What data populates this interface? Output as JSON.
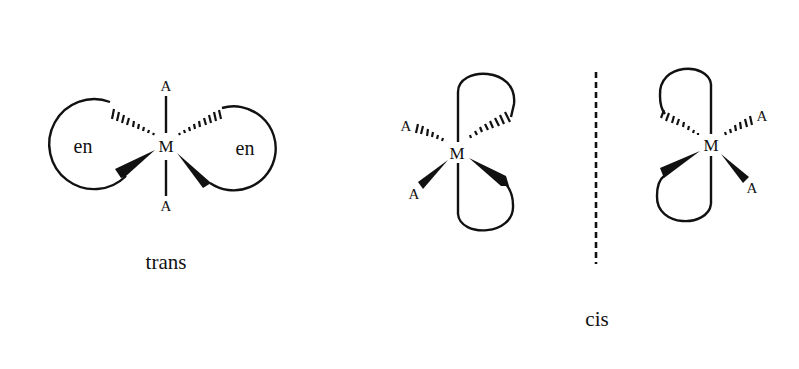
{
  "figure": {
    "trans": {
      "caption": "trans",
      "metal": "M",
      "ligand_top": "A",
      "ligand_bottom": "A",
      "chelate_left": "en",
      "chelate_right": "en"
    },
    "cis": {
      "caption": "cis",
      "left_isomer": {
        "metal": "M",
        "ligand_upper": "A",
        "ligand_lower": "A"
      },
      "right_isomer": {
        "metal": "M",
        "ligand_upper": "A",
        "ligand_lower": "A"
      },
      "mirror_plane": "dashed vertical line"
    }
  },
  "colors": {
    "ink": "#111111",
    "background": "#ffffff"
  }
}
